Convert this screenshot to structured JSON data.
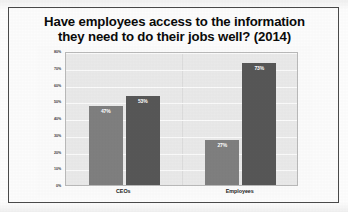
{
  "chart_data": {
    "type": "bar",
    "title": "Have employees access to the information they need to do their jobs well? (2014)",
    "title_lines": [
      "Have employees access to the information",
      "they need to do their jobs well? (2014)"
    ],
    "categories": [
      "CEOs",
      "Employees"
    ],
    "series": [
      {
        "name": "Yes",
        "values": [
          47,
          53
        ],
        "color": "#7f7f7f"
      },
      {
        "name": "No",
        "values": [
          27,
          73
        ],
        "color": "#575757"
      }
    ],
    "bars": [
      {
        "category": "CEOs",
        "value": 47,
        "label": "47%",
        "shade": "light"
      },
      {
        "category": "CEOs",
        "value": 53,
        "label": "53%",
        "shade": "dark"
      },
      {
        "category": "Employees",
        "value": 27,
        "label": "27%",
        "shade": "light"
      },
      {
        "category": "Employees",
        "value": 73,
        "label": "73%",
        "shade": "dark"
      }
    ],
    "xlabel": "",
    "ylabel": "",
    "ylim": [
      0,
      80
    ],
    "ytick_values": [
      0,
      10,
      20,
      30,
      40,
      50,
      60,
      70,
      80
    ],
    "ytick_labels": [
      "0%",
      "10%",
      "20%",
      "30%",
      "40%",
      "50%",
      "60%",
      "70%",
      "80%"
    ],
    "grid": true,
    "legend": "none",
    "plot_background": "#e9e9e9",
    "gridline_color": "#fbfbfb"
  }
}
